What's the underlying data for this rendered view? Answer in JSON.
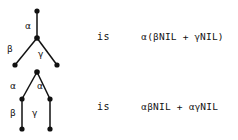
{
  "figure": {
    "type": "diagram",
    "background_color": "#ffffff",
    "ink_color": "#111111",
    "width": 238,
    "height": 140
  },
  "rows": [
    {
      "id": "row-1",
      "relation_word": "is",
      "tree": {
        "name": "branching-tree",
        "nodes": [
          {
            "id": "r1-root",
            "cx": 37,
            "cy": 11,
            "r": 2.6
          },
          {
            "id": "r1-mid",
            "cx": 37,
            "cy": 38,
            "r": 2.8
          },
          {
            "id": "r1-leaf-left",
            "cx": 15,
            "cy": 65,
            "r": 2.6
          },
          {
            "id": "r1-leaf-right",
            "cx": 57,
            "cy": 65,
            "r": 2.6
          }
        ],
        "edges": [
          {
            "id": "r1-e1",
            "from": "r1-root",
            "to": "r1-mid",
            "label": "α",
            "label_x": 25,
            "label_y": 22
          },
          {
            "id": "r1-e2",
            "from": "r1-mid",
            "to": "r1-leaf-left",
            "label": "β",
            "label_x": 7,
            "label_y": 45
          },
          {
            "id": "r1-e3",
            "from": "r1-mid",
            "to": "r1-leaf-right",
            "label": "γ",
            "label_x": 38,
            "label_y": 50
          }
        ]
      },
      "expression": {
        "text": "α(βNIL + γNIL)",
        "parts": [
          {
            "t": "α",
            "greek": true
          },
          {
            "t": "(",
            "greek": false
          },
          {
            "t": "β",
            "greek": true
          },
          {
            "t": "NIL + ",
            "greek": false
          },
          {
            "t": "γ",
            "greek": true
          },
          {
            "t": "NIL)",
            "greek": false
          }
        ]
      }
    },
    {
      "id": "row-2",
      "relation_word": "is",
      "tree": {
        "name": "duplicated-prefix-tree",
        "nodes": [
          {
            "id": "r2-root",
            "cx": 37,
            "cy": 72,
            "r": 2.8
          },
          {
            "id": "r2-mid-left",
            "cx": 22,
            "cy": 99,
            "r": 2.6
          },
          {
            "id": "r2-mid-right",
            "cx": 50,
            "cy": 99,
            "r": 2.6
          },
          {
            "id": "r2-leaf-left",
            "cx": 22,
            "cy": 129,
            "r": 2.6
          },
          {
            "id": "r2-leaf-right",
            "cx": 50,
            "cy": 129,
            "r": 2.6
          }
        ],
        "edges": [
          {
            "id": "r2-e1",
            "from": "r2-root",
            "to": "r2-mid-left",
            "label": "α",
            "label_x": 10,
            "label_y": 82
          },
          {
            "id": "r2-e2",
            "from": "r2-root",
            "to": "r2-mid-right",
            "label": "α",
            "label_x": 37,
            "label_y": 82
          },
          {
            "id": "r2-e3",
            "from": "r2-mid-left",
            "to": "r2-leaf-left",
            "label": "β",
            "label_x": 10,
            "label_y": 109
          },
          {
            "id": "r2-e4",
            "from": "r2-mid-right",
            "to": "r2-leaf-right",
            "label": "γ",
            "label_x": 32,
            "label_y": 109
          }
        ]
      },
      "expression": {
        "text": "αβNIL + αγNIL",
        "parts": [
          {
            "t": "α",
            "greek": true
          },
          {
            "t": "β",
            "greek": true
          },
          {
            "t": "NIL + ",
            "greek": false
          },
          {
            "t": "α",
            "greek": true
          },
          {
            "t": "γ",
            "greek": true
          },
          {
            "t": "NIL",
            "greek": false
          }
        ]
      }
    }
  ],
  "layout": {
    "is_x": 97,
    "is_row1_y": 32,
    "is_row2_y": 102,
    "expr_x": 141,
    "expr_row1_y": 32,
    "expr_row2_y": 102
  }
}
